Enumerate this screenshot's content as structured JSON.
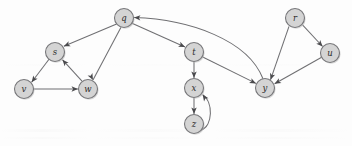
{
  "figure": {
    "kind": "directed-graph",
    "title": "",
    "background_color": "#fdfdfd",
    "node_fill": "#d4d4d4",
    "node_stroke": "#77777a",
    "edge_color": "#6f6f72",
    "arrowhead_color": "#4a4a4d",
    "node_radius": 9.5
  },
  "nodes": [
    {
      "id": "q",
      "label": "q",
      "x": 124,
      "y": 18
    },
    {
      "id": "s",
      "label": "s",
      "x": 55,
      "y": 52
    },
    {
      "id": "v",
      "label": "v",
      "x": 24,
      "y": 89
    },
    {
      "id": "w",
      "label": "w",
      "x": 88,
      "y": 89
    },
    {
      "id": "t",
      "label": "t",
      "x": 194,
      "y": 52
    },
    {
      "id": "x",
      "label": "x",
      "x": 194,
      "y": 88
    },
    {
      "id": "z",
      "label": "z",
      "x": 194,
      "y": 124
    },
    {
      "id": "y",
      "label": "y",
      "x": 265,
      "y": 88
    },
    {
      "id": "r",
      "label": "r",
      "x": 295,
      "y": 18
    },
    {
      "id": "u",
      "label": "u",
      "x": 330,
      "y": 53
    }
  ],
  "edges": [
    {
      "id": "q-s",
      "from": "q",
      "to": "s",
      "shape": "straight"
    },
    {
      "id": "q-w",
      "from": "q",
      "to": "w",
      "shape": "straight"
    },
    {
      "id": "q-t",
      "from": "q",
      "to": "t",
      "shape": "straight"
    },
    {
      "id": "s-v",
      "from": "s",
      "to": "v",
      "shape": "straight"
    },
    {
      "id": "v-w",
      "from": "v",
      "to": "w",
      "shape": "straight"
    },
    {
      "id": "w-s",
      "from": "w",
      "to": "s",
      "shape": "straight"
    },
    {
      "id": "t-x",
      "from": "t",
      "to": "x",
      "shape": "straight"
    },
    {
      "id": "t-y",
      "from": "t",
      "to": "y",
      "shape": "straight"
    },
    {
      "id": "x-z",
      "from": "x",
      "to": "z",
      "shape": "straight"
    },
    {
      "id": "z-x",
      "from": "z",
      "to": "x",
      "shape": "curved-right"
    },
    {
      "id": "y-q",
      "from": "y",
      "to": "q",
      "shape": "curved-arc"
    },
    {
      "id": "r-y",
      "from": "r",
      "to": "y",
      "shape": "straight"
    },
    {
      "id": "r-u",
      "from": "r",
      "to": "u",
      "shape": "straight"
    },
    {
      "id": "u-y",
      "from": "u",
      "to": "y",
      "shape": "straight"
    }
  ],
  "edge_paths": {
    "q-s": "M 116.6 24.0 L 63.8 46.3",
    "q-w": "M 121.0 27.3 L 93.0 79.9",
    "q-t": "M 132.0 23.2 L 185.0 46.9",
    "s-v": "M 49.2 59.0 L 31.6 82.2",
    "v-w": "M 33.5 89.0 L 77.9 89.0",
    "w-s": "M 82.0 81.2 L 62.4 59.7",
    "t-x": "M 194.0 61.5 L 194.0 77.9",
    "t-y": "M 202.2 56.7 L 256.0 83.4",
    "x-z": "M 194.0 97.5 L 194.0 113.9",
    "z-x": "M 201.0 130.2 C 213.0 126.0 213.5 102.0 202.6 94.6",
    "y-q": "M 263.0 78.8 C 248.0 40.0 190.0 19.5 134.0 17.6",
    "r-y": "M 289.0 26.3 L 270.5 79.8",
    "r-u": "M 302.5 24.8 L 322.6 46.5",
    "u-y": "M 321.2 57.5 L 274.6 83.8"
  },
  "arrowheads": {
    "q-s": {
      "x": 63.8,
      "y": 46.3,
      "angle": 157
    },
    "q-w": {
      "x": 93.0,
      "y": 79.9,
      "angle": 62
    },
    "q-t": {
      "x": 185.0,
      "y": 46.9,
      "angle": 24
    },
    "s-v": {
      "x": 31.6,
      "y": 82.2,
      "angle": 127
    },
    "v-w": {
      "x": 77.9,
      "y": 89.0,
      "angle": 0
    },
    "w-s": {
      "x": 62.4,
      "y": 59.7,
      "angle": -132
    },
    "t-x": {
      "x": 194.0,
      "y": 77.9,
      "angle": 90
    },
    "t-y": {
      "x": 256.0,
      "y": 83.4,
      "angle": 26
    },
    "x-z": {
      "x": 194.0,
      "y": 113.9,
      "angle": 90
    },
    "z-x": {
      "x": 202.6,
      "y": 94.6,
      "angle": -125
    },
    "y-q": {
      "x": 134.0,
      "y": 17.6,
      "angle": 182
    },
    "r-y": {
      "x": 270.5,
      "y": 79.8,
      "angle": 109
    },
    "r-u": {
      "x": 322.6,
      "y": 46.5,
      "angle": 47
    },
    "u-y": {
      "x": 274.6,
      "y": 83.8,
      "angle": 151
    }
  }
}
